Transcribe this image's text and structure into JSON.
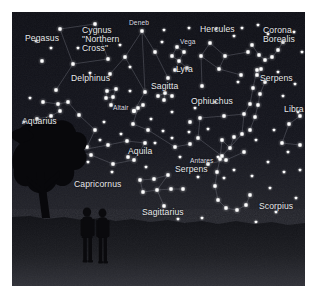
{
  "panel": {
    "x": 12,
    "y": 12,
    "width": 293,
    "height": 274,
    "sky_color": "#12131a",
    "sky_color_low": "#24252c",
    "ground_color": "#1b1c20",
    "star_color": "#ffffff",
    "line_color": "#8b8d99",
    "label_color": "#e8e9ec",
    "border_color": "#ffffff"
  },
  "horizon": {
    "y": 212,
    "glow_label": "horizon-glow"
  },
  "constellations": [
    {
      "name": "Pegasus",
      "label": "Pegasus",
      "label_x": 13,
      "label_y": 22,
      "size": "big",
      "stars": [
        [
          48,
          17
        ],
        [
          83,
          12
        ],
        [
          96,
          47
        ],
        [
          61,
          52
        ],
        [
          44,
          78
        ],
        [
          30,
          49
        ]
      ],
      "lines": [
        [
          0,
          1
        ],
        [
          1,
          2
        ],
        [
          2,
          3
        ],
        [
          3,
          0
        ],
        [
          3,
          4
        ]
      ]
    },
    {
      "name": "Cygnus",
      "label": "Cygnus\n\"Northern\nCross\"",
      "label_x": 70,
      "label_y": 14,
      "size": "big",
      "stars": [
        [
          130,
          19
        ],
        [
          113,
          45
        ],
        [
          98,
          62
        ],
        [
          143,
          40
        ],
        [
          156,
          66
        ],
        [
          133,
          80
        ],
        [
          122,
          99
        ]
      ],
      "lines": [
        [
          0,
          1
        ],
        [
          1,
          2
        ],
        [
          0,
          3
        ],
        [
          3,
          4
        ],
        [
          0,
          5
        ],
        [
          5,
          6
        ],
        [
          1,
          5
        ]
      ]
    },
    {
      "name": "Deneb",
      "label": "Deneb",
      "label_x": 117,
      "label_y": 7,
      "size": "small",
      "star_label": true
    },
    {
      "name": "Lyra",
      "label": "Lyra",
      "label_x": 164,
      "label_y": 53,
      "size": "big",
      "stars": [
        [
          165,
          35
        ],
        [
          172,
          40
        ],
        [
          160,
          44
        ],
        [
          167,
          49
        ],
        [
          175,
          56
        ],
        [
          163,
          58
        ]
      ],
      "lines": [
        [
          0,
          1
        ],
        [
          1,
          3
        ],
        [
          3,
          2
        ],
        [
          2,
          0
        ],
        [
          3,
          4
        ],
        [
          4,
          5
        ],
        [
          5,
          3
        ]
      ]
    },
    {
      "name": "Vega",
      "label": "Vega",
      "label_x": 168,
      "label_y": 26,
      "size": "small",
      "star_label": true
    },
    {
      "name": "Delphinus",
      "label": "Delphinus",
      "label_x": 59,
      "label_y": 62,
      "size": "big",
      "stars": [
        [
          95,
          79
        ],
        [
          104,
          77
        ],
        [
          101,
          85
        ],
        [
          94,
          86
        ],
        [
          99,
          93
        ]
      ],
      "lines": [
        [
          0,
          1
        ],
        [
          1,
          2
        ],
        [
          2,
          3
        ],
        [
          3,
          0
        ],
        [
          2,
          4
        ]
      ]
    },
    {
      "name": "Sagitta",
      "label": "Sagitta",
      "label_x": 139,
      "label_y": 70,
      "size": "big",
      "stars": [
        [
          146,
          84
        ],
        [
          153,
          81
        ],
        [
          160,
          84
        ],
        [
          152,
          88
        ]
      ],
      "lines": [
        [
          0,
          1
        ],
        [
          1,
          2
        ],
        [
          1,
          3
        ]
      ]
    },
    {
      "name": "Altair",
      "label": "Altair",
      "label_x": 101,
      "label_y": 92,
      "size": "small",
      "star_label": true
    },
    {
      "name": "Aquila",
      "label": "Aquila",
      "label_x": 116,
      "label_y": 135,
      "size": "big",
      "stars": [
        [
          126,
          96
        ],
        [
          122,
          99
        ],
        [
          131,
          93
        ],
        [
          121,
          112
        ],
        [
          136,
          118
        ],
        [
          163,
          135
        ],
        [
          178,
          132
        ],
        [
          116,
          145
        ]
      ],
      "lines": [
        [
          2,
          0
        ],
        [
          0,
          1
        ],
        [
          0,
          3
        ],
        [
          3,
          4
        ],
        [
          4,
          5
        ],
        [
          5,
          6
        ]
      ]
    },
    {
      "name": "Aquarius",
      "label": "Aquarius",
      "label_x": 10,
      "label_y": 105,
      "size": "big",
      "stars": [
        [
          31,
          90
        ],
        [
          46,
          92
        ],
        [
          56,
          90
        ],
        [
          48,
          99
        ],
        [
          39,
          104
        ],
        [
          25,
          107
        ],
        [
          67,
          103
        ],
        [
          83,
          118
        ],
        [
          75,
          135
        ]
      ],
      "lines": [
        [
          0,
          1
        ],
        [
          1,
          2
        ],
        [
          1,
          3
        ],
        [
          3,
          4
        ],
        [
          4,
          5
        ],
        [
          2,
          6
        ],
        [
          6,
          7
        ],
        [
          7,
          8
        ]
      ]
    },
    {
      "name": "Capricornus",
      "label": "Capricornus",
      "label_x": 62,
      "label_y": 168,
      "size": "big",
      "stars": [
        [
          58,
          136
        ],
        [
          64,
          139
        ],
        [
          79,
          143
        ],
        [
          101,
          152
        ],
        [
          122,
          148
        ],
        [
          133,
          131
        ],
        [
          115,
          129
        ],
        [
          96,
          133
        ]
      ],
      "lines": [
        [
          0,
          1
        ],
        [
          1,
          2
        ],
        [
          2,
          3
        ],
        [
          3,
          4
        ],
        [
          4,
          5
        ],
        [
          5,
          6
        ],
        [
          6,
          7
        ],
        [
          7,
          1
        ]
      ]
    },
    {
      "name": "Hercules",
      "label": "Hercules",
      "label_x": 188,
      "label_y": 13,
      "size": "big",
      "stars": [
        [
          198,
          31
        ],
        [
          189,
          44
        ],
        [
          213,
          44
        ],
        [
          207,
          57
        ],
        [
          190,
          74
        ],
        [
          229,
          63
        ],
        [
          236,
          40
        ]
      ],
      "lines": [
        [
          0,
          1
        ],
        [
          0,
          2
        ],
        [
          1,
          3
        ],
        [
          2,
          3
        ],
        [
          3,
          5
        ],
        [
          2,
          6
        ],
        [
          1,
          4
        ]
      ]
    },
    {
      "name": "Corona Borealis",
      "label": "Corona\nBorealis",
      "label_x": 251,
      "label_y": 14,
      "size": "big",
      "stars": [
        [
          240,
          33
        ],
        [
          247,
          43
        ],
        [
          253,
          48
        ],
        [
          260,
          45
        ],
        [
          266,
          38
        ],
        [
          271,
          30
        ]
      ],
      "lines": [
        [
          0,
          1
        ],
        [
          1,
          2
        ],
        [
          2,
          3
        ],
        [
          3,
          4
        ],
        [
          4,
          5
        ]
      ]
    },
    {
      "name": "Ophiuchus",
      "label": "Ophiuchus",
      "label_x": 179,
      "label_y": 85,
      "size": "big",
      "stars": [
        [
          188,
          106
        ],
        [
          212,
          104
        ],
        [
          232,
          102
        ],
        [
          241,
          76
        ],
        [
          245,
          58
        ],
        [
          238,
          92
        ],
        [
          230,
          122
        ],
        [
          210,
          144
        ],
        [
          186,
          126
        ],
        [
          178,
          110
        ]
      ],
      "lines": [
        [
          0,
          1
        ],
        [
          1,
          2
        ],
        [
          2,
          5
        ],
        [
          5,
          3
        ],
        [
          3,
          4
        ],
        [
          2,
          6
        ],
        [
          6,
          7
        ],
        [
          7,
          8
        ],
        [
          8,
          0
        ]
      ]
    },
    {
      "name": "Serpens-north",
      "label": "Serpens",
      "label_x": 248,
      "label_y": 62,
      "size": "big",
      "stars": [
        [
          249,
          57
        ],
        [
          245,
          63
        ],
        [
          253,
          70
        ],
        [
          248,
          82
        ],
        [
          246,
          93
        ],
        [
          243,
          105
        ],
        [
          238,
          118
        ]
      ],
      "lines": [
        [
          0,
          1
        ],
        [
          1,
          2
        ],
        [
          2,
          3
        ],
        [
          3,
          4
        ],
        [
          4,
          5
        ],
        [
          5,
          6
        ]
      ]
    },
    {
      "name": "Serpens-south",
      "label": "Serpens",
      "label_x": 163,
      "label_y": 153,
      "size": "big",
      "stars": [
        [
          196,
          152
        ],
        [
          214,
          148
        ],
        [
          232,
          140
        ]
      ],
      "lines": [
        [
          0,
          1
        ],
        [
          1,
          2
        ]
      ]
    },
    {
      "name": "Libra",
      "label": "Libra",
      "label_x": 272,
      "label_y": 93,
      "size": "big",
      "stars": [
        [
          277,
          112
        ],
        [
          288,
          104
        ],
        [
          270,
          131
        ],
        [
          288,
          133
        ]
      ],
      "lines": [
        [
          0,
          1
        ],
        [
          0,
          2
        ],
        [
          2,
          3
        ]
      ]
    },
    {
      "name": "Scorpius",
      "label": "Scorpius",
      "label_x": 247,
      "label_y": 190,
      "size": "big",
      "stars": [
        [
          210,
          128
        ],
        [
          218,
          136
        ],
        [
          222,
          125
        ],
        [
          208,
          147
        ],
        [
          205,
          160
        ],
        [
          203,
          174
        ],
        [
          206,
          188
        ],
        [
          214,
          196
        ],
        [
          225,
          198
        ],
        [
          234,
          193
        ],
        [
          238,
          183
        ]
      ],
      "lines": [
        [
          2,
          1
        ],
        [
          1,
          0
        ],
        [
          0,
          3
        ],
        [
          3,
          4
        ],
        [
          4,
          5
        ],
        [
          5,
          6
        ],
        [
          6,
          7
        ],
        [
          7,
          8
        ],
        [
          8,
          9
        ],
        [
          9,
          10
        ]
      ]
    },
    {
      "name": "Antares",
      "label": "Antares",
      "label_x": 178,
      "label_y": 145,
      "size": "small",
      "star_label": true
    },
    {
      "name": "Sagittarius",
      "label": "Sagittarius",
      "label_x": 130,
      "label_y": 196,
      "size": "big",
      "stars": [
        [
          156,
          163
        ],
        [
          142,
          167
        ],
        [
          128,
          168
        ],
        [
          131,
          180
        ],
        [
          145,
          178
        ],
        [
          159,
          177
        ],
        [
          171,
          177
        ],
        [
          152,
          194
        ]
      ],
      "lines": [
        [
          0,
          1
        ],
        [
          1,
          2
        ],
        [
          2,
          3
        ],
        [
          3,
          4
        ],
        [
          4,
          0
        ],
        [
          4,
          5
        ],
        [
          5,
          6
        ],
        [
          4,
          7
        ]
      ]
    }
  ],
  "field_stars": [
    [
      24,
      29
    ],
    [
      39,
      36
    ],
    [
      66,
      36
    ],
    [
      78,
      61
    ],
    [
      118,
      55
    ],
    [
      108,
      33
    ],
    [
      152,
      18
    ],
    [
      150,
      30
    ],
    [
      177,
      16
    ],
    [
      204,
      17
    ],
    [
      222,
      24
    ],
    [
      256,
      22
    ],
    [
      282,
      20
    ],
    [
      290,
      40
    ],
    [
      266,
      60
    ],
    [
      283,
      72
    ],
    [
      271,
      84
    ],
    [
      160,
      100
    ],
    [
      183,
      96
    ],
    [
      203,
      90
    ],
    [
      226,
      70
    ],
    [
      244,
      128
    ],
    [
      262,
      118
    ],
    [
      256,
      150
    ],
    [
      272,
      160
    ],
    [
      196,
      117
    ],
    [
      177,
      120
    ],
    [
      151,
      119
    ],
    [
      143,
      131
    ],
    [
      109,
      122
    ],
    [
      88,
      128
    ],
    [
      60,
      117
    ],
    [
      36,
      120
    ],
    [
      18,
      86
    ],
    [
      12,
      110
    ],
    [
      92,
      110
    ],
    [
      118,
      79
    ],
    [
      139,
      107
    ],
    [
      168,
      145
    ],
    [
      186,
      165
    ],
    [
      212,
      166
    ],
    [
      240,
      164
    ],
    [
      258,
      176
    ],
    [
      276,
      140
    ],
    [
      288,
      158
    ],
    [
      100,
      160
    ],
    [
      76,
      150
    ],
    [
      48,
      147
    ],
    [
      166,
      207
    ],
    [
      190,
      206
    ],
    [
      244,
      210
    ],
    [
      264,
      200
    ],
    [
      284,
      186
    ],
    [
      286,
      100
    ],
    [
      230,
      16
    ],
    [
      246,
      13
    ],
    [
      206,
      145
    ],
    [
      222,
      158
    ],
    [
      134,
      155
    ],
    [
      160,
      126
    ]
  ],
  "foreground": {
    "tree_name": "tree-silhouette",
    "figures_name": "people-silhouette",
    "figure_count": 2
  }
}
